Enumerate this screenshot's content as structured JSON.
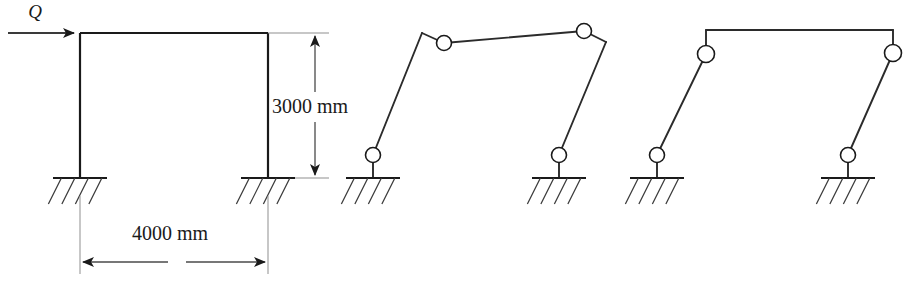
{
  "figure": {
    "canvas": {
      "width": 908,
      "height": 282
    },
    "stroke_color": "#1a1a1a",
    "background_color": "#ffffff"
  },
  "load": {
    "label": "Q",
    "label_x": 35,
    "label_y": 18,
    "arrow_y": 33,
    "arrow_x_start": 8,
    "arrow_x_end": 74
  },
  "dimensions": {
    "height": {
      "label": "3000 mm",
      "value": 3000,
      "unit": "mm",
      "text_x": 272,
      "text_y": 113,
      "line_x": 315,
      "line_y_top": 33,
      "line_y_bottom": 178
    },
    "width": {
      "label": "4000 mm",
      "value": 4000,
      "unit": "mm",
      "text_x": 132,
      "text_y": 240,
      "line_y": 262,
      "line_x_left": 80,
      "line_x_right": 268
    }
  },
  "panels": [
    {
      "name": "rigid-frame",
      "caption": "",
      "columns": [
        {
          "name": "left-column",
          "x1": 80,
          "y1": 33,
          "x2": 80,
          "y2": 178
        },
        {
          "name": "right-column",
          "x1": 268,
          "y1": 33,
          "x2": 268,
          "y2": 178
        }
      ],
      "beams": [
        {
          "name": "top-beam",
          "x1": 80,
          "y1": 33,
          "x2": 268,
          "y2": 33
        }
      ],
      "supports": [
        {
          "name": "left-fixed-support",
          "x": 80,
          "y": 178,
          "type": "fixed"
        },
        {
          "name": "right-fixed-support",
          "x": 268,
          "y": 178,
          "type": "fixed"
        }
      ],
      "hinges": []
    },
    {
      "name": "combined-mechanism",
      "caption": "",
      "members": [
        {
          "name": "left-column-member",
          "points": "373,155 422,33"
        },
        {
          "name": "left-beam-kink",
          "points": "422,33 444,43"
        },
        {
          "name": "top-beam-member",
          "points": "444,43 584,31"
        },
        {
          "name": "right-beam-kink",
          "points": "584,31 606,42"
        },
        {
          "name": "right-column-member",
          "points": "606,42 559,155"
        }
      ],
      "supports": [
        {
          "name": "left-pin-support",
          "x": 373,
          "y": 178,
          "type": "pinned"
        },
        {
          "name": "right-pin-support",
          "x": 559,
          "y": 178,
          "type": "pinned"
        }
      ],
      "hinges": [
        {
          "name": "hinge-base-left",
          "x": 373,
          "y": 155,
          "r": 7.5
        },
        {
          "name": "hinge-beam-left",
          "x": 444,
          "y": 43,
          "r": 7.5
        },
        {
          "name": "hinge-beam-right",
          "x": 584,
          "y": 31,
          "r": 7.5
        },
        {
          "name": "hinge-base-right",
          "x": 559,
          "y": 155,
          "r": 7.5
        }
      ]
    },
    {
      "name": "sway-mechanism",
      "caption": "",
      "members": [
        {
          "name": "left-column-member",
          "points": "657,155 706,54"
        },
        {
          "name": "left-joint-stub",
          "points": "706,54 706,30"
        },
        {
          "name": "top-beam-member",
          "points": "706,30 893,30"
        },
        {
          "name": "right-joint-stub",
          "points": "893,30 893,53"
        },
        {
          "name": "right-column-member",
          "points": "893,53 848,155"
        }
      ],
      "supports": [
        {
          "name": "left-pin-support",
          "x": 657,
          "y": 178,
          "type": "pinned"
        },
        {
          "name": "right-pin-support",
          "x": 848,
          "y": 178,
          "type": "pinned"
        }
      ],
      "hinges": [
        {
          "name": "hinge-base-left",
          "x": 657,
          "y": 155,
          "r": 7.5
        },
        {
          "name": "hinge-joint-left",
          "x": 706,
          "y": 54,
          "r": 8.5
        },
        {
          "name": "hinge-joint-right",
          "x": 893,
          "y": 53,
          "r": 8.5
        },
        {
          "name": "hinge-base-right",
          "x": 848,
          "y": 155,
          "r": 7.5
        }
      ]
    }
  ],
  "support_style": {
    "ground_half_width": 27,
    "hatch_count": 4,
    "hatch_length": 26,
    "hatch_slant_x": -13,
    "stub_length": 23
  }
}
